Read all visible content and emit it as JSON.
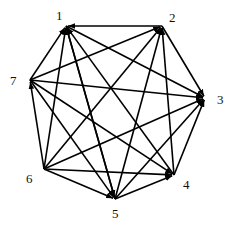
{
  "diagram": {
    "type": "directed-graph",
    "title": "",
    "colors": {
      "edge": "#000000",
      "label": "#111111",
      "background": "#ffffff"
    },
    "nodes": [
      {
        "id": "1",
        "label": "1",
        "x": 66,
        "y": 26,
        "lx": 56,
        "ly": 20
      },
      {
        "id": "2",
        "label": "2",
        "x": 162,
        "y": 26,
        "lx": 169,
        "ly": 22
      },
      {
        "id": "3",
        "label": "3",
        "x": 205,
        "y": 98,
        "lx": 217,
        "ly": 104
      },
      {
        "id": "4",
        "label": "4",
        "x": 174,
        "y": 175,
        "lx": 183,
        "ly": 189
      },
      {
        "id": "5",
        "label": "5",
        "x": 115,
        "y": 199,
        "lx": 112,
        "ly": 218
      },
      {
        "id": "6",
        "label": "6",
        "x": 44,
        "y": 169,
        "lx": 26,
        "ly": 183
      },
      {
        "id": "7",
        "label": "7",
        "x": 30,
        "y": 80,
        "lx": 10,
        "ly": 85
      }
    ],
    "edges": [
      {
        "from": "2",
        "to": "1"
      },
      {
        "from": "7",
        "to": "1"
      },
      {
        "from": "6",
        "to": "1"
      },
      {
        "from": "4",
        "to": "1"
      },
      {
        "from": "5",
        "to": "1"
      },
      {
        "from": "1",
        "to": "3"
      },
      {
        "from": "1",
        "to": "5"
      },
      {
        "from": "7",
        "to": "2"
      },
      {
        "from": "6",
        "to": "2"
      },
      {
        "from": "4",
        "to": "2"
      },
      {
        "from": "5",
        "to": "2"
      },
      {
        "from": "2",
        "to": "3"
      },
      {
        "from": "7",
        "to": "3"
      },
      {
        "from": "6",
        "to": "3"
      },
      {
        "from": "4",
        "to": "3"
      },
      {
        "from": "5",
        "to": "3"
      },
      {
        "from": "7",
        "to": "4"
      },
      {
        "from": "6",
        "to": "4"
      },
      {
        "from": "5",
        "to": "4"
      },
      {
        "from": "7",
        "to": "5"
      },
      {
        "from": "6",
        "to": "5"
      },
      {
        "from": "6",
        "to": "7"
      }
    ]
  }
}
